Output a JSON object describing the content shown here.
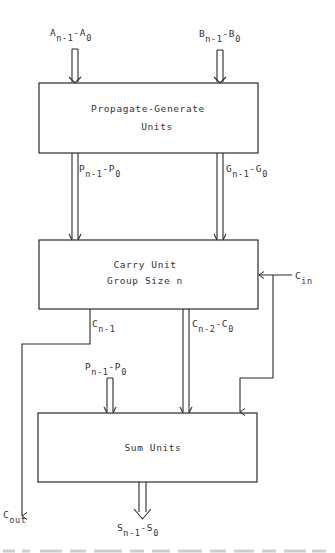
{
  "diagram": {
    "blocks": {
      "propagate_generate": {
        "line1": "Propagate-Generate",
        "line2": "Units"
      },
      "carry_unit": {
        "line1": "Carry Unit",
        "line2": "Group Size n"
      },
      "sum_units": {
        "line1": "Sum Units"
      }
    },
    "signals": {
      "a_input": {
        "base1": "A",
        "sub1": "n-1",
        "sep": "-",
        "base2": "A",
        "sub2": "0"
      },
      "b_input": {
        "base1": "B",
        "sub1": "n-1",
        "sep": "-",
        "base2": "B",
        "sub2": "0"
      },
      "p_bus": {
        "base1": "P",
        "sub1": "n-1",
        "sep": "-",
        "base2": "P",
        "sub2": "0"
      },
      "g_bus": {
        "base1": "G",
        "sub1": "n-1",
        "sep": "-",
        "base2": "G",
        "sub2": "0"
      },
      "c_in": {
        "base": "C",
        "sub": "in"
      },
      "c_n_minus_1": {
        "base": "C",
        "sub": "n-1"
      },
      "c_bus": {
        "base1": "C",
        "sub1": "n-2",
        "sep": "-",
        "base2": "C",
        "sub2": "0"
      },
      "p_bus_sum": {
        "base1": "P",
        "sub1": "n-1",
        "sep": "-",
        "base2": "P",
        "sub2": "0"
      },
      "c_out": {
        "base": "C",
        "sub": "out"
      },
      "s_output": {
        "base1": "S",
        "sub1": "n-1",
        "sep": "-",
        "base2": "S",
        "sub2": "0"
      }
    },
    "colors": {
      "line": "#2a2a2a",
      "text": "#333333",
      "background": "#ffffff"
    }
  }
}
